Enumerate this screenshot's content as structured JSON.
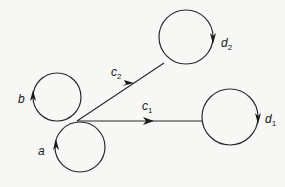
{
  "diagram": {
    "type": "directed graph with circular loops",
    "nodes": [
      {
        "id": "b",
        "label": "b",
        "kind": "loop",
        "direction": "counterclockwise"
      },
      {
        "id": "a",
        "label": "a",
        "kind": "loop",
        "direction": "counterclockwise"
      },
      {
        "id": "d1",
        "label": "d",
        "subscript": "1",
        "kind": "loop",
        "direction": "clockwise"
      },
      {
        "id": "d2",
        "label": "d",
        "subscript": "2",
        "kind": "loop",
        "direction": "clockwise"
      }
    ],
    "edges": [
      {
        "id": "c1",
        "label": "c",
        "subscript": "1",
        "from": "a/b junction",
        "to": "d1"
      },
      {
        "id": "c2",
        "label": "c",
        "subscript": "2",
        "from": "a/b junction",
        "to": "d2"
      }
    ]
  }
}
